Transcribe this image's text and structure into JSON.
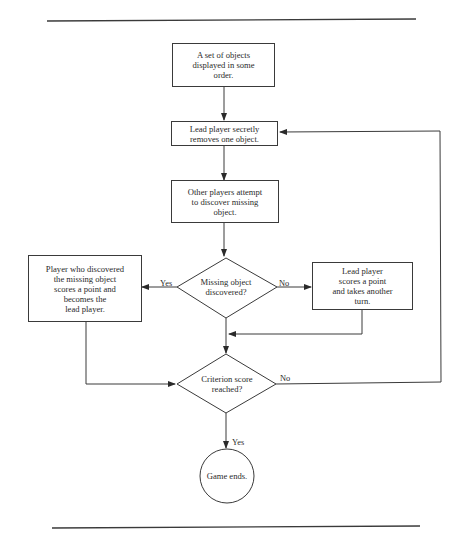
{
  "diagram": {
    "type": "flowchart",
    "nodes": {
      "start": {
        "shape": "rectangle",
        "text": "A set of objects\ndisplayed in some\norder."
      },
      "remove": {
        "shape": "rectangle",
        "text": "Lead player secretly\nremoves one object."
      },
      "discover": {
        "shape": "rectangle",
        "text": "Other players attempt\nto discover missing\nobject."
      },
      "decision_discovered": {
        "shape": "diamond",
        "text": "Missing object\ndiscovered?"
      },
      "yes_box": {
        "shape": "rectangle",
        "text": "Player who discovered\nthe missing object\nscores a point and\nbecomes the\nlead player."
      },
      "no_box": {
        "shape": "rectangle",
        "text": "Lead player\nscores a point\nand takes another\nturn."
      },
      "decision_criterion": {
        "shape": "diamond",
        "text": "Criterion score\nreached?"
      },
      "end": {
        "shape": "circle",
        "text": "Game ends."
      }
    },
    "edge_labels": {
      "discovered_yes": "Yes",
      "discovered_no": "No",
      "criterion_no": "No",
      "criterion_yes": "Yes"
    },
    "edges": [
      {
        "from": "start",
        "to": "remove"
      },
      {
        "from": "remove",
        "to": "discover"
      },
      {
        "from": "discover",
        "to": "decision_discovered"
      },
      {
        "from": "decision_discovered",
        "to": "yes_box",
        "label": "Yes"
      },
      {
        "from": "decision_discovered",
        "to": "no_box",
        "label": "No"
      },
      {
        "from": "no_box",
        "to": "decision_criterion"
      },
      {
        "from": "decision_discovered",
        "to": "decision_criterion"
      },
      {
        "from": "yes_box",
        "to": "decision_criterion"
      },
      {
        "from": "decision_criterion",
        "to": "remove",
        "label": "No"
      },
      {
        "from": "decision_criterion",
        "to": "end",
        "label": "Yes"
      }
    ],
    "colors": {
      "line": "#3a3a3a",
      "background": "#ffffff"
    }
  }
}
